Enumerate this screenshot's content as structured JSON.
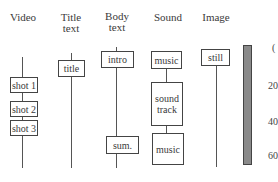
{
  "tracks": {
    "video": {
      "header": "Video",
      "clips": [
        "shot 1",
        "shot 2",
        "shot 3"
      ]
    },
    "title_text": {
      "header_line1": "Title",
      "header_line2": "text",
      "clips": [
        "title"
      ]
    },
    "body_text": {
      "header_line1": "Body",
      "header_line2": "text",
      "clips": [
        "intro",
        "sum."
      ]
    },
    "sound": {
      "header": "Sound",
      "clips": [
        "music",
        "sound track",
        "music"
      ]
    },
    "image": {
      "header": "Image",
      "clips": [
        "still"
      ]
    }
  },
  "timescale": {
    "ticks": [
      "(",
      "20",
      "40",
      "60"
    ],
    "bar_color": "#8a8a8a"
  }
}
